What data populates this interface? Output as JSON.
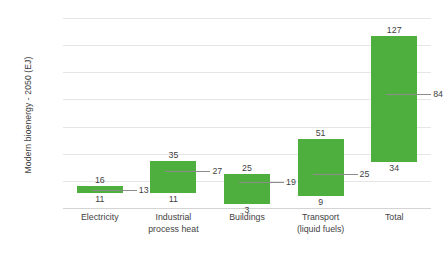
{
  "chart_data": {
    "type": "bar",
    "title": "",
    "xlabel": "",
    "ylabel": "Modern bioenergy - 2050 (EJ)",
    "ylim": [
      0,
      140
    ],
    "yticks": [
      0,
      20,
      40,
      60,
      80,
      100,
      120,
      140
    ],
    "grid": true,
    "legend": "none",
    "note": "Floating (range) bars: each bar spans from a low value to a high value, with a median marker line inside.",
    "categories": [
      "Electricity",
      "Industrial process heat",
      "Buildings",
      "Transport (liquid fuels)",
      "Total"
    ],
    "category_lines": [
      [
        "Electricity"
      ],
      [
        "Industrial",
        "process heat"
      ],
      [
        "Buildings"
      ],
      [
        "Transport",
        "(liquid fuels)"
      ],
      [
        "Total"
      ]
    ],
    "series": [
      {
        "name": "high",
        "values": [
          16,
          35,
          25,
          51,
          127
        ]
      },
      {
        "name": "low",
        "values": [
          11,
          11,
          3,
          9,
          34
        ]
      },
      {
        "name": "median",
        "values": [
          13,
          27,
          19,
          25,
          84
        ]
      }
    ],
    "bar_color": "#4EAF3E",
    "median_color": "#8c8c8c",
    "gridline_color": "#e6e6e6"
  }
}
